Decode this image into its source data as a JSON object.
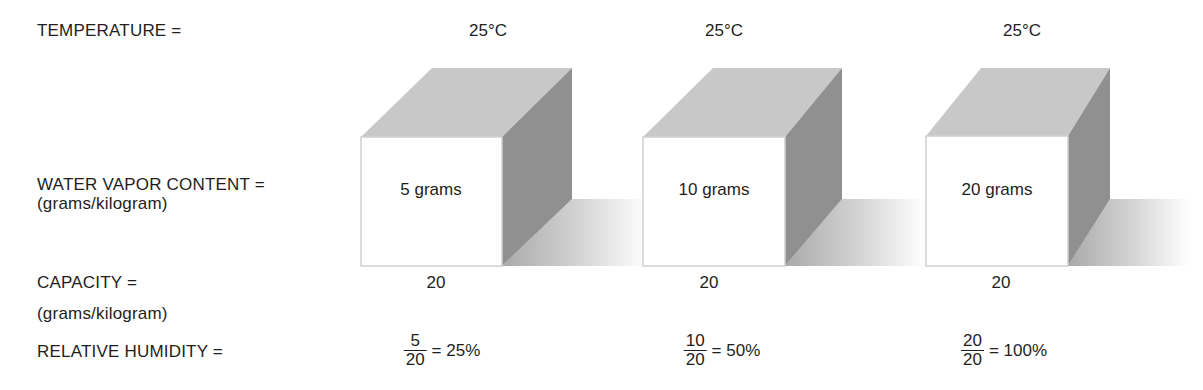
{
  "labels": {
    "temperature": "TEMPERATURE =",
    "water_vapor": "WATER VAPOR CONTENT =",
    "water_vapor_unit": "(grams/kilogram)",
    "capacity": "CAPACITY =",
    "capacity_unit": "(grams/kilogram)",
    "relative_humidity": "RELATIVE HUMIDITY ="
  },
  "columns": [
    {
      "temperature": "25°C",
      "water_vapor": "5 grams",
      "capacity": "20",
      "rh_numerator": "5",
      "rh_denominator": "20",
      "rh_result": "= 25%"
    },
    {
      "temperature": "25°C",
      "water_vapor": "10 grams",
      "capacity": "20",
      "rh_numerator": "10",
      "rh_denominator": "20",
      "rh_result": "= 50%"
    },
    {
      "temperature": "25°C",
      "water_vapor": "20 grams",
      "capacity": "20",
      "rh_numerator": "20",
      "rh_denominator": "20",
      "rh_result": "= 100%"
    }
  ],
  "colors": {
    "top_face": "#c9c9c9",
    "right_face": "#8f8f8f",
    "front_face": "#ffffff",
    "shadow": "#b5b5b5"
  }
}
